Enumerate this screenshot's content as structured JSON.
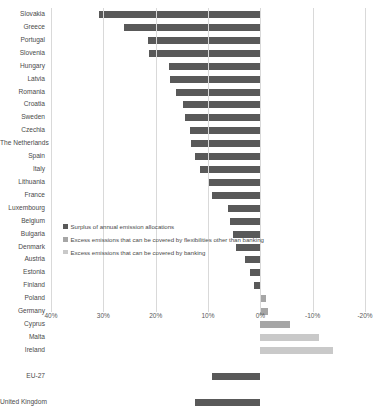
{
  "chart_data": {
    "type": "bar",
    "title": "",
    "xlabel": "",
    "ylabel": "",
    "orientation": "horizontal",
    "xlim": [
      40,
      -20
    ],
    "x_reversed": true,
    "grid": true,
    "xticks": [
      "40%",
      "30%",
      "20%",
      "10%",
      "0%",
      "-10%",
      "-20%"
    ],
    "xtick_values": [
      40,
      30,
      20,
      10,
      0,
      -10,
      -20
    ],
    "legend_position": "center",
    "legend": [
      "Surplus of annual emission allocations",
      "Excess emissions that can be covered by flexibilities other than banking",
      "Excess emissions that can be covered by banking"
    ],
    "colors": {
      "surplus": "#595959",
      "flexibilities": "#a6a6a6",
      "banking": "#c9c9c9",
      "gridline": "#d9d9d9",
      "text": "#4a4a4a"
    },
    "categories": [
      "Slovakia",
      "Greece",
      "Portugal",
      "Slovenia",
      "Hungary",
      "Latvia",
      "Romania",
      "Croatia",
      "Sweden",
      "Czechia",
      "The Netherlands",
      "Spain",
      "Italy",
      "Lithuania",
      "France",
      "Luxembourg",
      "Belgium",
      "Bulgaria",
      "Denmark",
      "Austria",
      "Estonia",
      "Finland",
      "Poland",
      "Germany",
      "Cyprus",
      "Malta",
      "Ireland",
      "",
      "EU-27",
      "",
      "United Kingdom"
    ],
    "series": [
      {
        "name": "Surplus of annual emission allocations",
        "color": "#595959",
        "values": [
          30.8,
          26.0,
          21.5,
          21.3,
          17.5,
          17.2,
          16.2,
          14.8,
          14.4,
          13.5,
          13.3,
          12.5,
          11.5,
          9.8,
          9.2,
          6.2,
          5.8,
          5.2,
          4.6,
          3.0,
          2.0,
          1.2,
          0,
          0,
          0,
          0,
          0,
          null,
          9.2,
          null,
          12.5
        ]
      },
      {
        "name": "Excess emissions that can be covered by flexibilities other than banking",
        "color": "#a6a6a6",
        "values": [
          0,
          0,
          0,
          0,
          0,
          0,
          0,
          0,
          0,
          0,
          0,
          0,
          0,
          0,
          0,
          0,
          0,
          0,
          0,
          0,
          0,
          0,
          -1.1,
          -1.4,
          -5.6,
          0,
          0,
          null,
          0,
          null,
          0
        ]
      },
      {
        "name": "Excess emissions that can be covered by banking",
        "color": "#c9c9c9",
        "values": [
          0,
          0,
          0,
          0,
          0,
          0,
          0,
          0,
          0,
          0,
          0,
          0,
          0,
          0,
          0,
          0,
          0,
          0,
          0,
          0,
          0,
          0,
          0,
          0,
          0,
          -11.3,
          -13.8,
          null,
          0,
          null,
          0
        ]
      }
    ]
  }
}
